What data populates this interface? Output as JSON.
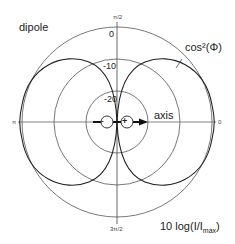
{
  "diagram": {
    "title": "dipole",
    "curve_label": "cos²(Φ)",
    "axis_label": "axis",
    "scale_label_main": "10 log(I/I",
    "scale_label_sub": "max",
    "scale_label_end": ")",
    "angle_labels": {
      "top": "π/2",
      "bottom": "3π/2",
      "left": "π",
      "right": "0"
    },
    "ring_labels": [
      "0",
      "-10",
      "-20"
    ],
    "charges": {
      "negative": "-",
      "positive": "+"
    },
    "colors": {
      "line": "#333333",
      "ring": "#555555",
      "background": "#ffffff"
    }
  }
}
